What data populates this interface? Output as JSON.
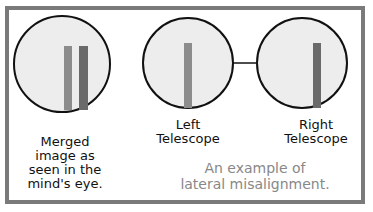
{
  "diagram": {
    "colors": {
      "frame": "#7a7a7a",
      "circle_fill": "#ededed",
      "circle_stroke": "#111111",
      "left_bar": "#8c8c8c",
      "right_bar": "#6a6a6a",
      "caption": "#888888"
    },
    "views": [
      {
        "id": "merged",
        "label": "Merged image as seen in the mind's eye.",
        "label_lines": [
          "Merged",
          "image as",
          "seen in the",
          "mind's eye."
        ]
      },
      {
        "id": "left",
        "label_lines": [
          "Left",
          "Telescope"
        ]
      },
      {
        "id": "right",
        "label_lines": [
          "Right",
          "Telescope"
        ]
      }
    ],
    "caption_lines": [
      "An example of",
      "lateral misalignment."
    ]
  }
}
